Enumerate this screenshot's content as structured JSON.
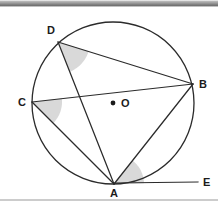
{
  "figure": {
    "background_color": "#ffffff",
    "stroke_color": "#2b2b2b",
    "shade_color": "#d8d8d8",
    "top_bar_color": "#8d8d8d",
    "baseline_color": "#9a9a9a",
    "circle": {
      "cx": 113,
      "cy": 103,
      "r": 81
    },
    "center_dot": {
      "x": 113,
      "y": 103,
      "r": 2.4
    },
    "points": [
      {
        "name": "A",
        "label": "A",
        "x": 114,
        "y": 184,
        "label_x": 110,
        "label_y": 188
      },
      {
        "name": "B",
        "label": "B",
        "x": 193,
        "y": 84,
        "label_x": 199,
        "label_y": 79
      },
      {
        "name": "C",
        "label": "C",
        "x": 32,
        "y": 102,
        "label_x": 18,
        "label_y": 97
      },
      {
        "name": "D",
        "label": "D",
        "x": 58,
        "y": 42,
        "label_x": 47,
        "label_y": 25
      },
      {
        "name": "E",
        "label": "E",
        "x": 198,
        "y": 182,
        "label_x": 203,
        "label_y": 177
      },
      {
        "name": "O",
        "label": "O",
        "x": 113,
        "y": 103,
        "label_x": 121,
        "label_y": 98
      }
    ],
    "segments": [
      {
        "name": "segment-DB",
        "from": "D",
        "to": "B"
      },
      {
        "name": "segment-DA",
        "from": "D",
        "to": "A"
      },
      {
        "name": "segment-CB",
        "from": "C",
        "to": "B"
      },
      {
        "name": "segment-CA",
        "from": "C",
        "to": "A"
      },
      {
        "name": "segment-AB",
        "from": "A",
        "to": "B"
      },
      {
        "name": "tangent-AE",
        "from": "A",
        "to": "E"
      }
    ],
    "shaded_angles": [
      {
        "name": "angle-BDA",
        "vertex": "D",
        "arms": [
          "B",
          "A"
        ],
        "label": "angle BDA"
      },
      {
        "name": "angle-BCA",
        "vertex": "C",
        "arms": [
          "B",
          "A"
        ],
        "label": "angle BCA"
      },
      {
        "name": "angle-BAE",
        "vertex": "A",
        "arms": [
          "B",
          "E"
        ],
        "label": "angle BAE"
      }
    ],
    "baseline": {
      "x1": 0,
      "y1": 200,
      "x2": 218,
      "y2": 200
    }
  }
}
